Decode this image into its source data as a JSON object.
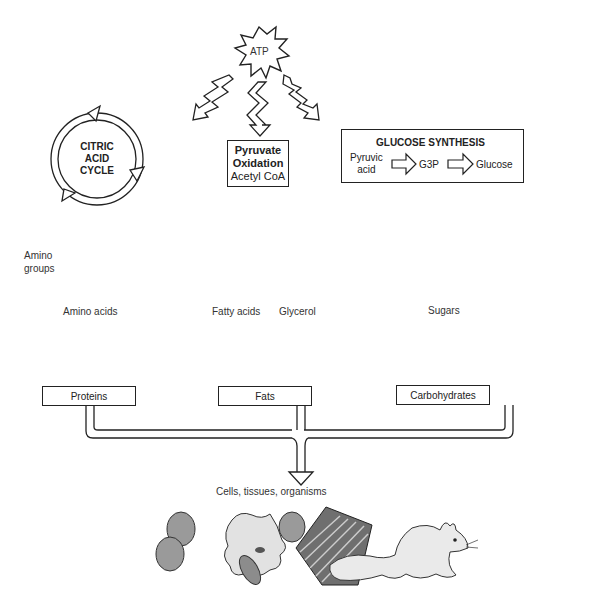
{
  "atp": {
    "label": "ATP"
  },
  "citric_cycle": {
    "line1": "CITRIC",
    "line2": "ACID",
    "line3": "CYCLE"
  },
  "pyruvate_box": {
    "line1": "Pyruvate",
    "line2": "Oxidation",
    "line3": "Acetyl CoA"
  },
  "glucose_synthesis": {
    "title": "GLUCOSE SYNTHESIS",
    "input_line1": "Pyruvic",
    "input_line2": "acid",
    "intermediate": "G3P",
    "output": "Glucose"
  },
  "amino_groups": {
    "line1": "Amino",
    "line2": "groups"
  },
  "monomers": {
    "amino_acids": "Amino acids",
    "fatty_acids": "Fatty acids",
    "glycerol": "Glycerol",
    "sugars": "Sugars"
  },
  "macromolecules": {
    "proteins": "Proteins",
    "fats": "Fats",
    "carbohydrates": "Carbohydrates"
  },
  "result": {
    "label": "Cells, tissues, organisms"
  }
}
